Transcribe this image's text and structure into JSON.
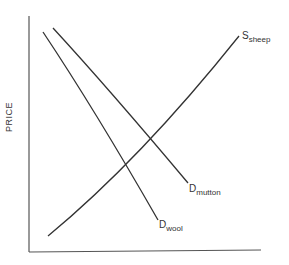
{
  "diagram": {
    "type": "supply-demand",
    "y_axis_label": "PRICE",
    "x_axis_label": "",
    "curves": [
      {
        "name": "S",
        "subscript": "sheep",
        "kind": "supply",
        "start": [
          48,
          236
        ],
        "end": [
          239,
          36
        ]
      },
      {
        "name": "D",
        "subscript": "mutton",
        "kind": "demand",
        "start": [
          53,
          28
        ],
        "end": [
          188,
          183
        ]
      },
      {
        "name": "D",
        "subscript": "wool",
        "kind": "demand",
        "start": [
          43,
          32
        ],
        "end": [
          158,
          220
        ]
      }
    ],
    "line_color": "#333333"
  }
}
